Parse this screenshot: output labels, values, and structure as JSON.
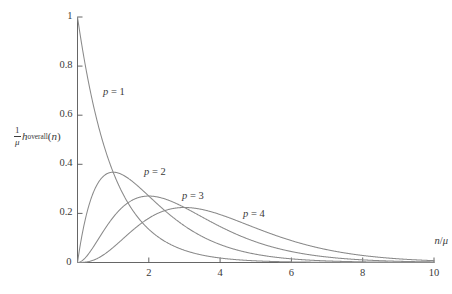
{
  "figure": {
    "background": "#ffffff",
    "curve_color": "#8a8a8a",
    "axis_color": "#555555",
    "text_color": "#3a3a3a"
  },
  "axes": {
    "x_title_numerator": "n",
    "x_title_slash": "/",
    "x_title_denominator": "μ",
    "y_title_frac_num": "1",
    "y_title_frac_den": "μ",
    "y_title_h": "h",
    "y_title_sub": "overall",
    "y_title_open": "(",
    "y_title_var": "n",
    "y_title_close": ")",
    "x_ticks": [
      "2",
      "4",
      "6",
      "8",
      "10"
    ],
    "y_ticks": [
      "0",
      "0.2",
      "0.4",
      "0.6",
      "0.8",
      "1"
    ],
    "origin_label": "0"
  },
  "curve_labels": [
    {
      "name": "p-1-label",
      "var": "p",
      "eq": " = ",
      "value": "1",
      "x": 103,
      "y": 86
    },
    {
      "name": "p-2-label",
      "var": "p",
      "eq": " = ",
      "value": "2",
      "x": 144,
      "y": 166
    },
    {
      "name": "p-3-label",
      "var": "p",
      "eq": " = ",
      "value": "3",
      "x": 182,
      "y": 190
    },
    {
      "name": "p-4-label",
      "var": "p",
      "eq": " = ",
      "value": "4",
      "x": 243,
      "y": 208
    }
  ],
  "caption": {
    "text": ""
  },
  "chart_data": {
    "type": "line",
    "title": "",
    "subtitle": "",
    "xlabel": "n/μ",
    "ylabel": "(1/μ) h_overall(n)",
    "xlim": [
      0,
      10
    ],
    "ylim": [
      0,
      1
    ],
    "xticks": [
      0,
      2,
      4,
      6,
      8,
      10
    ],
    "yticks": [
      0,
      0.2,
      0.4,
      0.6,
      0.8,
      1
    ],
    "grid": false,
    "legend": "inline-annotations",
    "series": [
      {
        "name": "p = 1",
        "p": 1,
        "peak_x": 0.0,
        "peak_y": 1.0,
        "x": [
          0,
          0.25,
          0.5,
          0.75,
          1,
          1.25,
          1.5,
          1.75,
          2,
          2.5,
          3,
          3.5,
          4,
          4.5,
          5,
          5.5,
          6,
          6.5,
          7,
          7.5,
          8,
          8.5,
          9,
          9.5,
          10
        ],
        "values": [
          1.0,
          0.779,
          0.607,
          0.472,
          0.368,
          0.287,
          0.223,
          0.174,
          0.135,
          0.082,
          0.05,
          0.03,
          0.018,
          0.011,
          0.007,
          0.004,
          0.002,
          0.0015,
          0.0009,
          0.0006,
          0.0003,
          0.0002,
          0.0001,
          0.0001,
          0.0
        ]
      },
      {
        "name": "p = 2",
        "p": 2,
        "peak_x": 1.0,
        "peak_y": 0.368,
        "x": [
          0,
          0.25,
          0.5,
          0.75,
          1,
          1.25,
          1.5,
          1.75,
          2,
          2.5,
          3,
          3.5,
          4,
          4.5,
          5,
          5.5,
          6,
          6.5,
          7,
          7.5,
          8,
          8.5,
          9,
          9.5,
          10
        ],
        "values": [
          0.0,
          0.195,
          0.303,
          0.354,
          0.368,
          0.358,
          0.335,
          0.304,
          0.271,
          0.205,
          0.149,
          0.106,
          0.073,
          0.05,
          0.034,
          0.022,
          0.015,
          0.01,
          0.006,
          0.004,
          0.003,
          0.002,
          0.001,
          0.001,
          0.0
        ]
      },
      {
        "name": "p = 3",
        "p": 3,
        "peak_x": 2.0,
        "peak_y": 0.271,
        "x": [
          0,
          0.25,
          0.5,
          0.75,
          1,
          1.25,
          1.5,
          1.75,
          2,
          2.5,
          3,
          3.5,
          4,
          4.5,
          5,
          5.5,
          6,
          6.5,
          7,
          7.5,
          8,
          8.5,
          9,
          9.5,
          10
        ],
        "values": [
          0.0,
          0.024,
          0.076,
          0.133,
          0.184,
          0.224,
          0.251,
          0.266,
          0.271,
          0.257,
          0.224,
          0.185,
          0.147,
          0.113,
          0.084,
          0.062,
          0.045,
          0.032,
          0.022,
          0.016,
          0.011,
          0.007,
          0.005,
          0.003,
          0.002
        ]
      },
      {
        "name": "p = 4",
        "p": 4,
        "peak_x": 3.0,
        "peak_y": 0.224,
        "x": [
          0,
          0.25,
          0.5,
          0.75,
          1,
          1.25,
          1.5,
          1.75,
          2,
          2.5,
          3,
          3.5,
          4,
          4.5,
          5,
          5.5,
          6,
          6.5,
          7,
          7.5,
          8,
          8.5,
          9,
          9.5,
          10
        ],
        "values": [
          0.0,
          0.002,
          0.013,
          0.033,
          0.061,
          0.093,
          0.126,
          0.155,
          0.18,
          0.214,
          0.224,
          0.216,
          0.195,
          0.169,
          0.14,
          0.114,
          0.089,
          0.069,
          0.052,
          0.039,
          0.029,
          0.021,
          0.015,
          0.01,
          0.007
        ]
      }
    ]
  }
}
